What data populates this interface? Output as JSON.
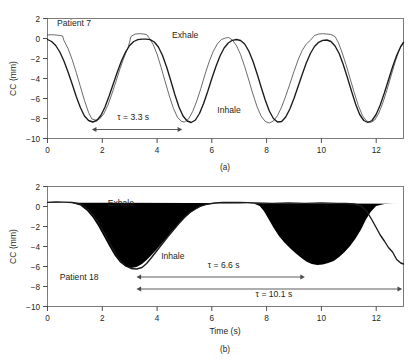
{
  "figure": {
    "panels": [
      {
        "id": "a",
        "caption": "(a)",
        "patient_label": "Patient 7",
        "annotations": {
          "exhale": "Exhale",
          "inhale": "Inhale",
          "tau": "τ = 3.3 s"
        },
        "axes": {
          "ylabel": "CC (mm)",
          "xlabel": "",
          "yticks": [
            "2",
            "0",
            "−2",
            "−4",
            "−6",
            "−8",
            "−10"
          ],
          "xticks": [
            "0",
            "2",
            "4",
            "6",
            "8",
            "10",
            "12"
          ]
        }
      },
      {
        "id": "b",
        "caption": "(b)",
        "patient_label": "Patient 18",
        "annotations": {
          "exhale": "Exhale",
          "inhale": "Inhale",
          "tau_short": "τ = 6.6 s",
          "tau_long": "τ = 10.1 s"
        },
        "axes": {
          "ylabel": "CC (mm)",
          "xlabel": "Time (s)",
          "yticks": [
            "2",
            "0",
            "−2",
            "−4",
            "−6",
            "−8",
            "−10"
          ],
          "xticks": [
            "0",
            "2",
            "4",
            "6",
            "8",
            "10",
            "12"
          ]
        }
      }
    ]
  },
  "chart_data": [
    {
      "type": "line",
      "id": "panel-a",
      "title": "Patient 7",
      "xlabel": "",
      "ylabel": "CC (mm)",
      "xlim": [
        0,
        13
      ],
      "ylim": [
        -10,
        2
      ],
      "xticks": [
        0,
        2,
        4,
        6,
        8,
        10,
        12
      ],
      "yticks": [
        2,
        0,
        -2,
        -4,
        -6,
        -8,
        -10
      ],
      "grid": false,
      "legend": null,
      "annotations": [
        {
          "text": "Patient 7",
          "x": 0.35,
          "y": 1.25
        },
        {
          "text": "Exhale",
          "x": 4.55,
          "y": 0.05
        },
        {
          "text": "Inhale",
          "x": 6.2,
          "y": -7.4
        },
        {
          "text": "τ = 3.3 s",
          "x": 2.55,
          "y": -8.1,
          "arrow": {
            "style": "double-headed",
            "x_start": 1.62,
            "x_end": 4.92,
            "y": -9.1
          }
        }
      ],
      "series": [
        {
          "name": "model-fit",
          "style": "thick",
          "x": [
            0.0,
            0.15,
            0.3,
            0.45,
            0.6,
            0.75,
            0.9,
            1.05,
            1.2,
            1.35,
            1.5,
            1.65,
            1.8,
            1.95,
            2.1,
            2.25,
            2.4,
            2.55,
            2.7,
            2.85,
            3.0,
            3.15,
            3.3,
            3.45,
            3.6,
            3.75,
            3.9,
            4.05,
            4.2,
            4.35,
            4.5,
            4.65,
            4.8,
            4.95,
            5.1,
            5.25,
            5.4,
            5.55,
            5.7,
            5.85,
            6.0,
            6.15,
            6.3,
            6.45,
            6.6,
            6.75,
            6.9,
            7.05,
            7.2,
            7.35,
            7.5,
            7.65,
            7.8,
            7.95,
            8.1,
            8.25,
            8.4,
            8.55,
            8.7,
            8.85,
            9.0,
            9.15,
            9.3,
            9.45,
            9.6,
            9.75,
            9.9,
            10.05,
            10.2,
            10.35,
            10.5,
            10.65,
            10.8,
            10.95,
            11.1,
            11.25,
            11.4,
            11.55,
            11.7,
            11.85,
            12.0,
            12.15,
            12.3,
            12.45,
            12.6,
            12.75,
            12.9,
            13.0
          ],
          "y": [
            -0.1,
            -0.3,
            -0.7,
            -1.35,
            -2.25,
            -3.35,
            -4.55,
            -5.8,
            -6.9,
            -7.75,
            -8.2,
            -8.35,
            -8.2,
            -7.7,
            -6.85,
            -5.75,
            -4.55,
            -3.35,
            -2.25,
            -1.35,
            -0.7,
            -0.3,
            -0.12,
            -0.06,
            -0.06,
            -0.12,
            -0.35,
            -0.85,
            -1.7,
            -2.85,
            -4.2,
            -5.6,
            -6.85,
            -7.75,
            -8.25,
            -8.4,
            -8.15,
            -7.5,
            -6.5,
            -5.3,
            -4.0,
            -2.8,
            -1.75,
            -0.95,
            -0.45,
            -0.18,
            -0.1,
            -0.2,
            -0.55,
            -1.25,
            -2.25,
            -3.5,
            -4.85,
            -6.15,
            -7.25,
            -8.0,
            -8.35,
            -8.3,
            -7.85,
            -7.05,
            -6.0,
            -4.8,
            -3.6,
            -2.45,
            -1.5,
            -0.8,
            -0.38,
            -0.18,
            -0.15,
            -0.3,
            -0.75,
            -1.5,
            -2.6,
            -3.9,
            -5.25,
            -6.55,
            -7.6,
            -8.2,
            -8.4,
            -8.2,
            -7.6,
            -6.65,
            -5.45,
            -4.15,
            -2.85,
            -1.7,
            -0.8,
            -0.4
          ]
        },
        {
          "name": "measured",
          "style": "thin",
          "x": [
            0.0,
            0.15,
            0.3,
            0.45,
            0.55,
            0.6,
            0.75,
            0.9,
            1.05,
            1.2,
            1.35,
            1.5,
            1.62,
            1.75,
            1.9,
            2.05,
            2.2,
            2.35,
            2.5,
            2.65,
            2.8,
            2.95,
            3.05,
            3.2,
            3.35,
            3.5,
            3.62,
            3.7,
            3.85,
            4.0,
            4.15,
            4.3,
            4.45,
            4.6,
            4.75,
            4.9,
            5.0,
            5.15,
            5.3,
            5.45,
            5.6,
            5.75,
            5.9,
            6.05,
            6.2,
            6.35,
            6.5,
            6.62,
            6.75,
            6.9,
            7.05,
            7.2,
            7.35,
            7.5,
            7.65,
            7.8,
            7.95,
            8.1,
            8.25,
            8.4,
            8.55,
            8.7,
            8.85,
            9.0,
            9.15,
            9.3,
            9.45,
            9.6,
            9.75,
            9.9,
            10.05,
            10.2,
            10.35,
            10.5,
            10.62,
            10.75,
            10.9,
            11.05,
            11.2,
            11.35,
            11.5,
            11.65,
            11.8,
            11.95,
            12.1,
            12.25,
            12.4,
            12.55,
            12.7,
            12.85,
            13.0
          ],
          "y": [
            0.35,
            0.38,
            0.35,
            0.3,
            0.25,
            -0.2,
            -1.0,
            -2.1,
            -3.4,
            -4.8,
            -6.2,
            -7.4,
            -8.05,
            -8.15,
            -8.05,
            -7.55,
            -6.7,
            -5.55,
            -4.3,
            -3.0,
            -1.85,
            -0.85,
            0.2,
            0.45,
            0.48,
            0.45,
            0.4,
            0.1,
            -0.55,
            -1.55,
            -2.9,
            -4.35,
            -5.75,
            -7.0,
            -7.9,
            -8.3,
            -8.35,
            -8.05,
            -7.3,
            -6.25,
            -5.0,
            -3.6,
            -2.35,
            -1.3,
            -0.55,
            -0.1,
            0.05,
            0.1,
            -0.15,
            -0.7,
            -1.6,
            -2.8,
            -4.15,
            -5.55,
            -6.8,
            -7.75,
            -8.3,
            -8.45,
            -8.25,
            -7.7,
            -6.85,
            -5.75,
            -4.55,
            -3.3,
            -2.15,
            -1.2,
            -0.55,
            -0.18,
            0.3,
            0.45,
            0.48,
            0.45,
            0.4,
            0.2,
            -0.4,
            -1.35,
            -2.6,
            -4.0,
            -5.4,
            -6.7,
            -7.7,
            -8.25,
            -8.4,
            -8.15,
            -7.45,
            -6.4,
            -5.1,
            -3.7,
            -2.3,
            -1.1,
            -0.35
          ]
        }
      ]
    },
    {
      "type": "line",
      "id": "panel-b",
      "title": "Patient 18",
      "xlabel": "Time (s)",
      "ylabel": "CC (mm)",
      "xlim": [
        0,
        13
      ],
      "ylim": [
        -10,
        2
      ],
      "xticks": [
        0,
        2,
        4,
        6,
        8,
        10,
        12
      ],
      "yticks": [
        2,
        0,
        -2,
        -4,
        -6,
        -8,
        -10
      ],
      "grid": false,
      "legend": null,
      "annotations": [
        {
          "text": "Exhale",
          "x": 2.2,
          "y": 0.05
        },
        {
          "text": "Inhale",
          "x": 4.15,
          "y": -5.25
        },
        {
          "text": "Patient 18",
          "x": 0.45,
          "y": -7.35
        },
        {
          "text": "τ = 6.6 s",
          "x": 5.85,
          "y": -6.1,
          "arrow": {
            "style": "double-headed",
            "x_start": 3.25,
            "x_end": 9.4,
            "y": -7.05
          }
        },
        {
          "text": "τ = 10.1 s",
          "x": 7.6,
          "y": -9.0,
          "arrow": {
            "style": "double-headed",
            "x_start": 3.25,
            "x_end": 12.95,
            "y": -8.25
          }
        }
      ],
      "series": [
        {
          "name": "trace-bold",
          "style": "thick",
          "x": [
            0.0,
            0.3,
            0.6,
            0.9,
            1.2,
            1.45,
            1.65,
            1.85,
            2.05,
            2.25,
            2.45,
            2.65,
            2.85,
            3.05,
            3.25,
            3.45,
            3.62,
            3.8,
            4.0,
            4.2,
            4.4,
            4.6,
            4.8,
            5.0,
            5.2,
            5.4,
            5.6,
            5.8,
            6.1,
            6.4,
            6.7,
            7.0,
            7.3,
            7.6,
            7.9,
            8.2,
            8.5,
            8.8,
            9.1,
            9.4,
            9.7,
            10.0,
            10.3,
            10.6,
            10.9,
            11.2,
            11.45,
            11.65,
            11.85,
            12.0,
            12.15,
            12.3,
            12.45,
            12.6,
            12.75,
            12.9,
            13.0
          ],
          "y": [
            0.42,
            0.45,
            0.44,
            0.4,
            0.25,
            -0.25,
            -0.8,
            -1.6,
            -2.55,
            -3.55,
            -4.55,
            -5.4,
            -5.95,
            -6.2,
            -6.25,
            -6.1,
            -5.7,
            -5.1,
            -4.4,
            -3.7,
            -3.0,
            -2.35,
            -1.7,
            -1.1,
            -0.6,
            -0.25,
            0.05,
            0.22,
            0.35,
            0.4,
            0.42,
            0.4,
            0.38,
            0.36,
            0.34,
            0.32,
            0.34,
            0.36,
            0.34,
            0.32,
            0.34,
            0.36,
            0.34,
            0.32,
            0.3,
            0.25,
            0.05,
            -0.45,
            -1.35,
            -2.1,
            -2.85,
            -3.45,
            -4.1,
            -4.55,
            -5.3,
            -5.65,
            -5.75
          ]
        },
        {
          "name": "trace-thin",
          "style": "thin",
          "x": [
            0.0,
            0.3,
            0.6,
            0.9,
            1.2,
            1.45,
            1.65,
            1.85,
            2.05,
            2.25,
            2.45,
            2.65,
            2.85,
            3.05,
            3.25,
            3.45,
            3.62,
            3.8,
            4.0,
            4.2,
            4.4,
            4.6,
            4.8,
            5.0,
            5.2,
            5.4,
            5.6,
            5.8,
            6.1,
            6.4,
            6.7,
            7.0,
            7.3,
            7.55,
            7.75,
            7.9,
            8.05,
            8.25,
            8.45,
            8.65,
            8.85,
            9.05,
            9.25,
            9.45,
            9.65,
            9.85,
            10.05,
            10.25,
            10.45,
            10.65,
            10.85,
            11.05,
            11.25,
            11.45,
            11.62,
            11.8,
            12.0,
            12.3,
            12.6,
            12.9,
            13.0
          ],
          "y": [
            0.4,
            0.42,
            0.4,
            0.34,
            0.1,
            -0.45,
            -1.1,
            -1.95,
            -2.95,
            -3.95,
            -4.9,
            -5.6,
            -6.0,
            -6.15,
            -6.05,
            -5.75,
            -5.35,
            -4.85,
            -4.25,
            -3.6,
            -2.95,
            -2.3,
            -1.7,
            -1.15,
            -0.65,
            -0.3,
            0.0,
            0.18,
            0.3,
            0.35,
            0.36,
            0.34,
            0.32,
            0.28,
            0.05,
            -0.45,
            -1.15,
            -2.1,
            -2.95,
            -3.6,
            -4.15,
            -4.65,
            -5.1,
            -5.5,
            -5.75,
            -5.85,
            -5.8,
            -5.65,
            -5.45,
            -5.05,
            -4.55,
            -3.95,
            -3.2,
            -2.3,
            -1.35,
            -0.55,
            0.05,
            0.25,
            0.28,
            0.28,
            0.27
          ]
        }
      ]
    }
  ]
}
